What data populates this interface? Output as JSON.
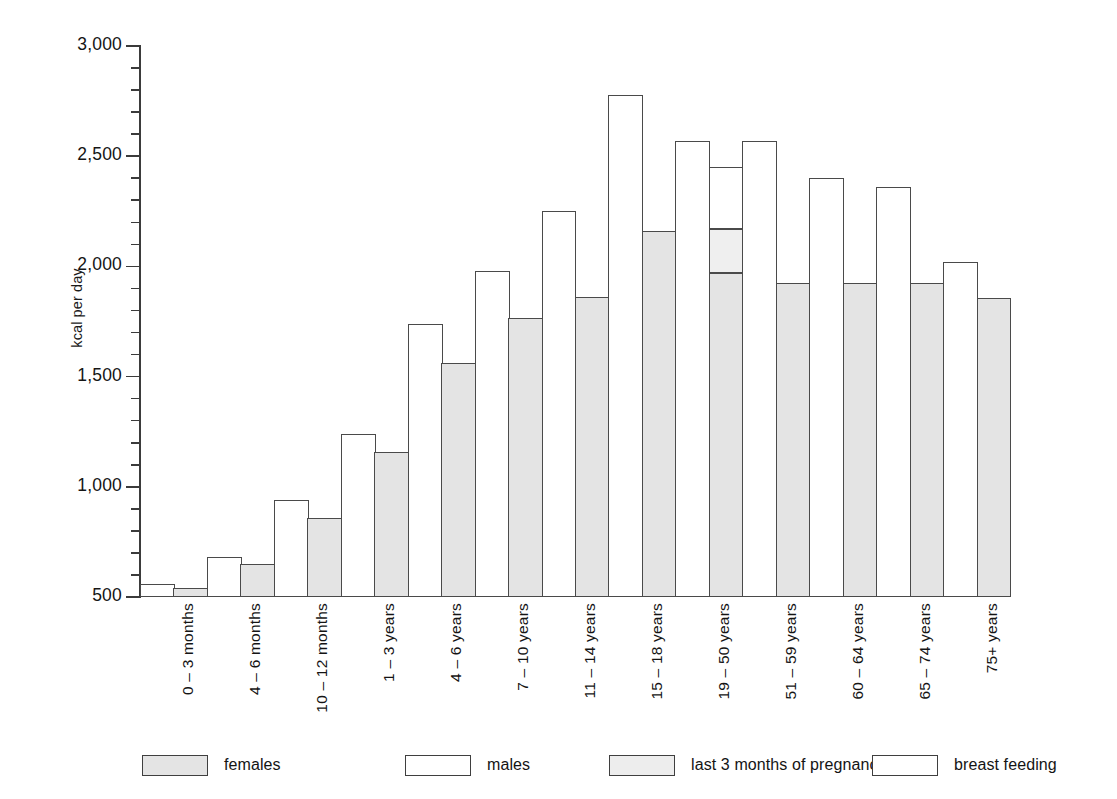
{
  "chart_data": {
    "type": "bar",
    "title": "",
    "xlabel": "",
    "ylabel": "kcal per day",
    "ylim": [
      500,
      3000
    ],
    "y_major_ticks": [
      500,
      1000,
      1500,
      2000,
      2500,
      3000
    ],
    "y_tick_labels": [
      "500",
      "1,000",
      "1,500",
      "2,000",
      "2,500",
      "3,000"
    ],
    "y_minor_tick_step": 100,
    "grid": false,
    "legend_position": "bottom",
    "bar_style": "grouped-contiguous",
    "categories": [
      "0 – 3 months",
      "4 – 6 months",
      "10 – 12 months",
      "1 – 3 years",
      "4 – 6 years",
      "7 – 10 years",
      "11 – 14 years",
      "15 – 18 years",
      "19 – 50 years",
      "51 – 59 years",
      "60 – 64 years",
      "65 – 74 years",
      "75+ years"
    ],
    "series": [
      {
        "name": "males",
        "color": "#ffffff",
        "values": [
          560,
          680,
          940,
          1240,
          1740,
          1980,
          2250,
          2780,
          2570,
          2570,
          2400,
          2360,
          2020
        ]
      },
      {
        "name": "females",
        "color": "#e4e4e4",
        "values": [
          540,
          650,
          860,
          1160,
          1560,
          1765,
          1860,
          2160,
          1970,
          1925,
          1925,
          1925,
          1855
        ]
      },
      {
        "name": "last 3 months of pregnancy",
        "color": "#efefef",
        "values": [
          null,
          null,
          null,
          null,
          null,
          null,
          null,
          null,
          2170,
          null,
          null,
          null,
          null
        ]
      },
      {
        "name": "breast feeding",
        "color": "#ffffff",
        "values": [
          null,
          null,
          null,
          null,
          null,
          null,
          null,
          null,
          2450,
          null,
          null,
          null,
          null
        ]
      }
    ]
  },
  "legend": {
    "items": [
      {
        "label": "females",
        "swatch": "females"
      },
      {
        "label": "males",
        "swatch": "males"
      },
      {
        "label": "last 3 months of pregnancy",
        "swatch": "pregnancy"
      },
      {
        "label": "breast feeding",
        "swatch": "breast"
      }
    ]
  },
  "axis": {
    "y_title": "kcal per day"
  }
}
